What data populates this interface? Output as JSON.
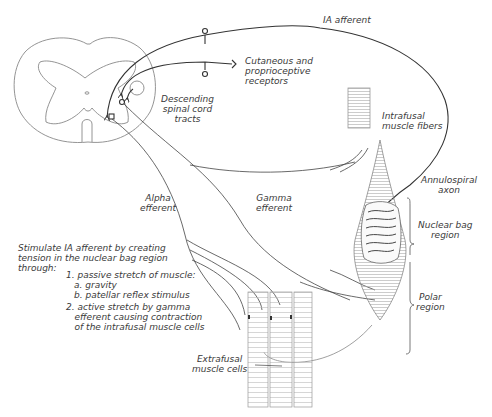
{
  "diagram": {
    "type": "anatomical-schematic",
    "line_color": "#333333",
    "light_line_color": "#8a8a8a",
    "labels": {
      "ia_afferent": "IA afferent",
      "cutaneous": "Cutaneous and\nproprioceptive\nreceptors",
      "descending": "Descending\nspinal cord\ntracts",
      "intrafusal": "Intrafusal\nmuscle fibers",
      "annulospiral": "Annulospiral\naxon",
      "nuclear_bag": "Nuclear bag\nregion",
      "polar": "Polar\nregion",
      "alpha": "Alpha\nefferent",
      "gamma": "Gamma\nefferent",
      "extrafusal": "Extrafusal\nmuscle cells"
    },
    "note": {
      "intro": "Stimulate IA afferent by creating\ntension in the nuclear bag region\nthrough:",
      "item1": "1. passive stretch of muscle:",
      "item1a": "a. gravity",
      "item1b": "b. patellar reflex stimulus",
      "item2": "2. active stretch by gamma\n   efferent causing contraction\n   of the intrafusal muscle cells"
    }
  }
}
